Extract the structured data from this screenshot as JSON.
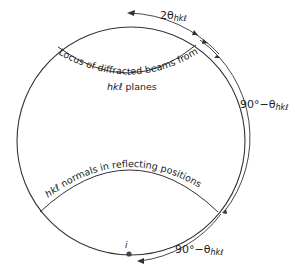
{
  "diagram": {
    "type": "stereographic-projection",
    "labels": {
      "top_angle": "2θ",
      "top_angle_sub": "hkℓ",
      "right_angle": "90°−θ",
      "right_angle_sub": "hkℓ",
      "bottom_angle": "90°−θ",
      "bottom_angle_sub": "hkℓ",
      "locus_line1": "Locus of diffracted beams from",
      "locus_line2_italic": "hkℓ",
      "locus_line2_rest": " planes",
      "normals_italic": "hkℓ",
      "normals_rest": " normals in reflecting positions",
      "point_i": "i"
    },
    "colors": {
      "stroke": "#333333",
      "text": "#222222",
      "point": "#444444"
    }
  }
}
